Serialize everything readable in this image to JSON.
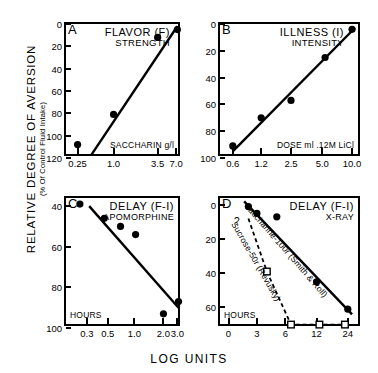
{
  "figure": {
    "y_axis_label": "RELATIVE DEGREE OF AVERSION",
    "y_axis_sublabel": "(% Of Control Fluid Intake)",
    "x_axis_label": "LOG UNITS"
  },
  "chart_data": [
    {
      "type": "scatter",
      "panel": "A",
      "title": "FLAVOR (F)",
      "subtitle": "STRENGTH",
      "xlabel": "SACCHARIN g/l",
      "ylabel": "RELATIVE DEGREE OF AVERSION (% Of Control Fluid Intake)",
      "xticklabels": [
        "0.25",
        "1.0",
        "3.5",
        "7.0"
      ],
      "x": [
        0.25,
        1.0,
        3.5,
        7.0
      ],
      "yticklabels": [
        "0",
        "20",
        "40",
        "60",
        "80",
        "100",
        "120"
      ],
      "ylim": [
        120,
        0
      ],
      "y_inverted": true,
      "values": [
        108,
        81,
        12,
        5
      ],
      "grid": false,
      "fit_line": {
        "x": [
          0.42,
          7.0
        ],
        "y": [
          117,
          2
        ]
      },
      "marker": "filled-circle"
    },
    {
      "type": "scatter",
      "panel": "B",
      "title": "ILLNESS (I)",
      "subtitle": "INTENSITY",
      "xlabel": "DOSE ml .12M LiCl",
      "ylabel": "RELATIVE DEGREE OF AVERSION (% Of Control Fluid Intake)",
      "xticklabels": [
        "0.6",
        "1.2",
        "2.5",
        "5.0",
        "10.0"
      ],
      "x": [
        0.6,
        1.2,
        2.5,
        5.0,
        10.0
      ],
      "yticklabels": [
        "0",
        "20",
        "40",
        "60",
        "80",
        "100"
      ],
      "ylim": [
        100,
        0
      ],
      "y_inverted": true,
      "values": [
        91,
        70,
        57,
        25,
        4
      ],
      "grid": false,
      "fit_line": {
        "x": [
          0.6,
          10.0
        ],
        "y": [
          95,
          3
        ]
      },
      "marker": "filled-circle"
    },
    {
      "type": "scatter",
      "panel": "C",
      "title": "DELAY (F-I)",
      "subtitle": "APOMORPHINE",
      "xlabel": "HOURS",
      "ylabel": "RELATIVE DEGREE OF AVERSION (% Of Control Fluid Intake)",
      "xticklabels": [
        "0.3",
        "0.5",
        "1.0",
        "2.0",
        "3.0"
      ],
      "x": [
        0.25,
        0.45,
        0.7,
        1.0,
        2.0,
        3.0
      ],
      "yticklabels": [
        "40",
        "60",
        "80",
        "100"
      ],
      "ylim": [
        100,
        36
      ],
      "y_inverted": true,
      "values": [
        39,
        46,
        50,
        54,
        93,
        87
      ],
      "grid": false,
      "fit_line": {
        "x": [
          0.3,
          3.0
        ],
        "y": [
          40,
          90
        ]
      },
      "marker": "filled-circle"
    },
    {
      "type": "scatter",
      "panel": "D",
      "title": "DELAY (F-I)",
      "subtitle": "X-RAY",
      "xlabel": "HOURS",
      "ylabel": "RELATIVE DEGREE OF AVERSION (% Of Control Fluid Intake)",
      "xticklabels": [
        "0",
        "3",
        "6",
        "12",
        "24"
      ],
      "yticklabels": [
        "0",
        "20",
        "40",
        "60"
      ],
      "ylim": [
        72,
        -4
      ],
      "y_inverted": true,
      "grid": false,
      "series": [
        {
          "name": "Saccharine-100r (Smith & Roll)",
          "label": "Saccharine-100r (Smith & Roll)",
          "marker": "filled-circle",
          "linestyle": "solid",
          "x": [
            2,
            3,
            6,
            12,
            24
          ],
          "values": [
            1,
            5,
            7,
            45,
            61
          ],
          "fit_line": {
            "x": [
              1.5,
              24
            ],
            "y": [
              -2,
              64
            ]
          }
        },
        {
          "name": "Sucrose-50r (Revusky)",
          "label": "Sucrose-50r (Revusky)",
          "marker": "open-square",
          "linestyle": "dashed",
          "annotation": "?",
          "x": [
            4.5,
            8,
            16,
            24
          ],
          "values": [
            39,
            70,
            70,
            70
          ]
        }
      ]
    }
  ]
}
